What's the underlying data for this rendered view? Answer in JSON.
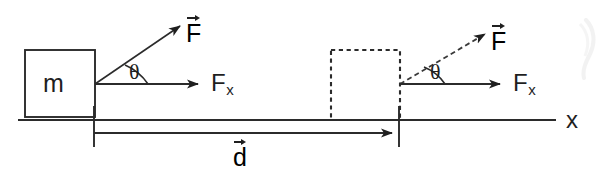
{
  "figure": {
    "type": "physics-force-work-diagram",
    "background_color": "#ffffff",
    "line_color": "#2b2b2b",
    "labels": {
      "mass": "m",
      "angle_left": "θ",
      "angle_right": "θ",
      "force_vector_left": "F",
      "force_vector_right": "F",
      "force_x_left": "F",
      "force_x_left_sub": "x",
      "force_x_right": "F",
      "force_x_right_sub": "x",
      "displacement": "d",
      "axis": "x"
    },
    "elements": {
      "solid_block": {
        "name": "initial-block",
        "style": "solid",
        "x": 25,
        "y": 50,
        "width": 70,
        "height": 67,
        "label": "m"
      },
      "dashed_block": {
        "name": "final-block",
        "style": "dashed",
        "x": 331,
        "y": 50,
        "width": 69,
        "height": 70,
        "label": ""
      },
      "axis_line": {
        "name": "x-axis",
        "x1": 18,
        "y1": 120,
        "x2": 556,
        "y2": 120,
        "label": "x"
      },
      "force_arrow_left": {
        "style": "solid",
        "x1": 95,
        "y1": 84,
        "x2": 184,
        "y2": 24,
        "label": "F"
      },
      "force_arrow_right": {
        "style": "dashed",
        "x1": 400,
        "y1": 84,
        "x2": 489,
        "y2": 32,
        "label": "F"
      },
      "fx_arrow_left": {
        "style": "solid",
        "x1": 95,
        "y1": 84,
        "x2": 205,
        "y2": 84,
        "label": "Fx"
      },
      "fx_arrow_right": {
        "style": "solid",
        "x1": 400,
        "y1": 84,
        "x2": 507,
        "y2": 84,
        "label": "Fx"
      },
      "displacement_arrow": {
        "style": "solid",
        "x1": 94,
        "y1": 133,
        "x2": 399,
        "y2": 133,
        "label": "d"
      },
      "tick_left": {
        "x": 94,
        "y1": 106,
        "y2": 147
      },
      "tick_right": {
        "x": 399,
        "y1": 106,
        "y2": 147
      }
    }
  }
}
